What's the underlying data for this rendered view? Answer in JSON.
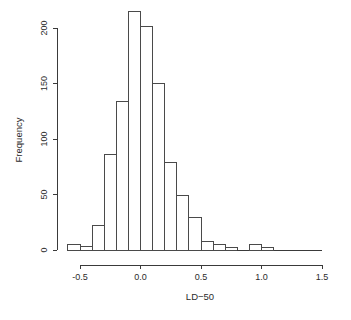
{
  "chart_data": {
    "type": "bar",
    "title": "",
    "subtitle": "",
    "xlabel": "LD−50",
    "ylabel": "Frequency",
    "grid": false,
    "legend": null,
    "legend_position": "none",
    "xlim": [
      -0.65,
      1.55
    ],
    "ylim": [
      0,
      215
    ],
    "bin_width": 0.1,
    "xticks": [
      -0.5,
      0.0,
      0.5,
      1.0,
      1.5
    ],
    "xtick_labels": [
      "-0.5",
      "0.0",
      "0.5",
      "1.0",
      "1.5"
    ],
    "yticks": [
      0,
      50,
      100,
      150,
      200
    ],
    "ytick_labels": [
      "0",
      "50",
      "100",
      "150",
      "200"
    ],
    "bin_edges": [
      -0.6,
      -0.5,
      -0.4,
      -0.3,
      -0.2,
      -0.1,
      0.0,
      0.1,
      0.2,
      0.3,
      0.4,
      0.5,
      0.6,
      0.7,
      0.8,
      0.9,
      1.0,
      1.1,
      1.2,
      1.3,
      1.4,
      1.5
    ],
    "categories": [
      "-0.6",
      "-0.5",
      "-0.4",
      "-0.3",
      "-0.2",
      "-0.1",
      "0.0",
      "0.1",
      "0.2",
      "0.3",
      "0.4",
      "0.5",
      "0.6",
      "0.7",
      "0.8",
      "0.9",
      "1.0",
      "1.1",
      "1.2",
      "1.3",
      "1.4"
    ],
    "values": [
      5,
      3,
      22,
      86,
      134,
      215,
      201,
      150,
      79,
      49,
      29,
      8,
      5,
      2,
      0,
      5,
      2,
      0,
      0,
      0,
      0
    ]
  },
  "axes": {
    "x_title": "LD−50",
    "y_title": "Frequency"
  }
}
